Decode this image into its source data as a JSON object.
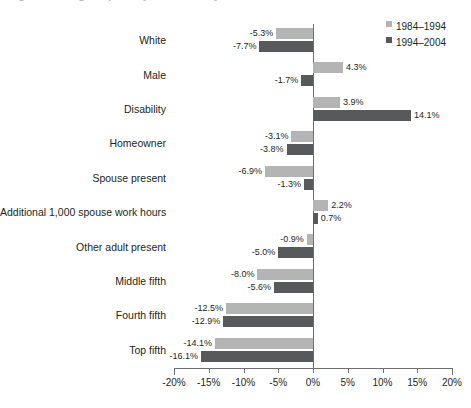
{
  "title_partial": "Figure: Change in poverty-exit rates by characteristic",
  "legend": {
    "position": "top-right",
    "items": [
      {
        "label": "1984–1994",
        "color": "#b4b4b4",
        "swatch": "light"
      },
      {
        "label": "1994–2004",
        "color": "#58595b",
        "swatch": "dark"
      }
    ]
  },
  "axis": {
    "ticks": [
      "-20%",
      "-15%",
      "-10%",
      "-5%",
      "0%",
      "5%",
      "10%",
      "15%",
      "20%"
    ],
    "tick_values": [
      -20,
      -15,
      -10,
      -5,
      0,
      5,
      10,
      15,
      20
    ]
  },
  "chart_data": {
    "type": "bar",
    "orientation": "horizontal",
    "title": "",
    "xlabel": "",
    "ylabel": "",
    "xlim": [
      -20,
      20
    ],
    "grid": false,
    "legend_position": "top-right",
    "categories": [
      "White",
      "Male",
      "Disability",
      "Homeowner",
      "Spouse present",
      "Additional 1,000 spouse work hours",
      "Other adult present",
      "Middle fifth",
      "Fourth fifth",
      "Top fifth"
    ],
    "series": [
      {
        "name": "1984–1994",
        "color": "#b4b4b4",
        "values": [
          -5.3,
          4.3,
          3.9,
          -3.1,
          -6.9,
          2.2,
          -0.9,
          -8.0,
          -12.5,
          -14.1
        ],
        "labels": [
          "-5.3%",
          "4.3%",
          "3.9%",
          "-3.1%",
          "-6.9%",
          "2.2%",
          "-0.9%",
          "-8.0%",
          "-12.5%",
          "-14.1%"
        ]
      },
      {
        "name": "1994–2004",
        "color": "#58595b",
        "values": [
          -7.7,
          -1.7,
          14.1,
          -3.8,
          -1.3,
          0.7,
          -5.0,
          -5.6,
          -12.9,
          -16.1
        ],
        "labels": [
          "-7.7%",
          "-1.7%",
          "14.1%",
          "-3.8%",
          "-1.3%",
          "0.7%",
          "-5.0%",
          "-5.6%",
          "-12.9%",
          "-16.1%"
        ]
      }
    ]
  }
}
